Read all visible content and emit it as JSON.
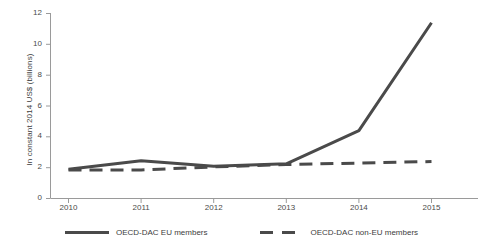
{
  "chart_data": {
    "type": "line",
    "title": "",
    "xlabel": "",
    "ylabel": "In constant 2014 US$ (billions)",
    "categories": [
      "2010",
      "2011",
      "2012",
      "2013",
      "2014",
      "2015"
    ],
    "x": [
      2010,
      2011,
      2012,
      2013,
      2014,
      2015
    ],
    "xlim": [
      2010,
      2015
    ],
    "ylim": [
      0,
      12
    ],
    "yticks": [
      "0",
      "2",
      "4",
      "6",
      "8",
      "10",
      "12"
    ],
    "ytick_values": [
      0,
      2,
      4,
      6,
      8,
      10,
      12
    ],
    "grid": false,
    "legend_position": "bottom",
    "series": [
      {
        "name": "OECD-DAC EU members",
        "style": "solid",
        "color": "#4a4a4a",
        "values": [
          1.9,
          2.45,
          2.1,
          2.25,
          4.4,
          11.4
        ]
      },
      {
        "name": "OECD-DAC non-EU members",
        "style": "dashed",
        "color": "#4a4a4a",
        "values": [
          1.85,
          1.85,
          2.05,
          2.2,
          2.3,
          2.4
        ]
      }
    ]
  },
  "axis": {
    "ytick_labels": [
      "12",
      "10",
      "8",
      "6",
      "4",
      "2",
      "0"
    ],
    "xtick_labels": [
      "2010",
      "2011",
      "2012",
      "2013",
      "2014",
      "2015"
    ],
    "y_axis_title": "In constant 2014 US$ (billions)"
  },
  "legend": {
    "items": [
      {
        "label": "OECD-DAC EU members",
        "style": "solid"
      },
      {
        "label": "OECD-DAC non-EU members",
        "style": "dashed"
      }
    ]
  },
  "colors": {
    "line": "#4a4a4a",
    "axis": "#9a9a9a",
    "text": "#3d3d3d",
    "background": "#ffffff"
  }
}
